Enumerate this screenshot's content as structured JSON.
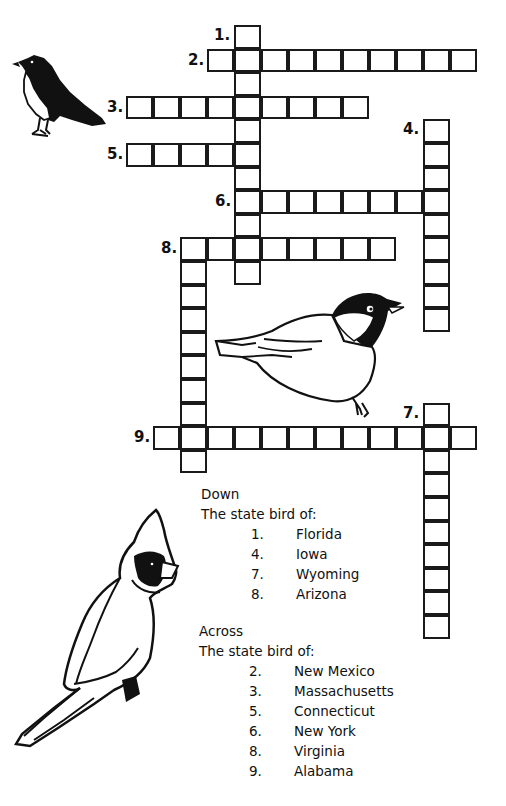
{
  "puzzle": {
    "type": "crossword",
    "theme": "State birds",
    "cell": {
      "origin_x": 126,
      "origin_y": 25,
      "width": 27,
      "height": 23.6
    },
    "entries": [
      {
        "number": "1.",
        "direction": "down",
        "col": 4,
        "row": 0,
        "length": 11
      },
      {
        "number": "2.",
        "direction": "across",
        "col": 3,
        "row": 1,
        "length": 10
      },
      {
        "number": "3.",
        "direction": "across",
        "col": 0,
        "row": 3,
        "length": 9
      },
      {
        "number": "4.",
        "direction": "down",
        "col": 11,
        "row": 4,
        "length": 9
      },
      {
        "number": "5.",
        "direction": "across",
        "col": 0,
        "row": 5,
        "length": 5
      },
      {
        "number": "6.",
        "direction": "across",
        "col": 4,
        "row": 7,
        "length": 8
      },
      {
        "number": "7.",
        "direction": "down",
        "col": 11,
        "row": 16,
        "length": 10
      },
      {
        "number": "8.",
        "direction": "across",
        "col": 2,
        "row": 9,
        "length": 8
      },
      {
        "number": "8.",
        "direction": "down",
        "col": 2,
        "row": 9,
        "length": 10
      },
      {
        "number": "9.",
        "direction": "across",
        "col": 1,
        "row": 17,
        "length": 12
      }
    ]
  },
  "clues": {
    "down": {
      "heading": "Down",
      "subheading": "The state bird of:",
      "items": [
        {
          "num": "1.",
          "text": "Florida"
        },
        {
          "num": "4.",
          "text": "Iowa"
        },
        {
          "num": "7.",
          "text": "Wyoming"
        },
        {
          "num": "8.",
          "text": "Arizona"
        }
      ]
    },
    "across": {
      "heading": "Across",
      "subheading": "The state bird of:",
      "items": [
        {
          "num": "2.",
          "text": "New Mexico"
        },
        {
          "num": "3.",
          "text": "Massachusetts"
        },
        {
          "num": "5.",
          "text": "Connecticut"
        },
        {
          "num": "6.",
          "text": "New York"
        },
        {
          "num": "8.",
          "text": "Virginia"
        },
        {
          "num": "9.",
          "text": "Alabama"
        }
      ]
    }
  },
  "illustrations": [
    "robin-illustration",
    "chickadee-illustration",
    "cardinal-illustration"
  ]
}
